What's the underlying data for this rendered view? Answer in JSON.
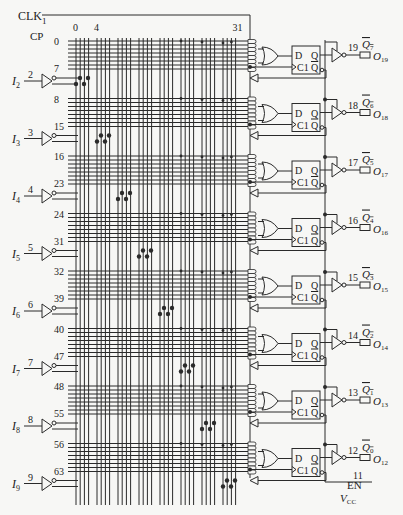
{
  "diagram": {
    "clock_label": "CLK",
    "clock_pin": "1",
    "cp_label": "CP",
    "column_labels": [
      {
        "col": 0,
        "text": "0"
      },
      {
        "col": 4,
        "text": "4"
      },
      {
        "col": 31,
        "text": "31"
      }
    ],
    "inputs": [
      {
        "name": "I",
        "sub": "2",
        "pin": "2",
        "row_first": "0",
        "row_last": "7"
      },
      {
        "name": "I",
        "sub": "3",
        "pin": "3",
        "row_first": "8",
        "row_last": "15"
      },
      {
        "name": "I",
        "sub": "4",
        "pin": "4",
        "row_first": "16",
        "row_last": "23"
      },
      {
        "name": "I",
        "sub": "5",
        "pin": "5",
        "row_first": "24",
        "row_last": "31"
      },
      {
        "name": "I",
        "sub": "6",
        "pin": "6",
        "row_first": "32",
        "row_last": "39"
      },
      {
        "name": "I",
        "sub": "7",
        "pin": "7",
        "row_first": "40",
        "row_last": "47"
      },
      {
        "name": "I",
        "sub": "8",
        "pin": "8",
        "row_first": "48",
        "row_last": "55"
      },
      {
        "name": "I",
        "sub": "9",
        "pin": "9",
        "row_first": "56",
        "row_last": "63"
      }
    ],
    "outputs": [
      {
        "pin": "19",
        "q": "Q",
        "q_sub": "7",
        "o": "O",
        "o_sub": "19"
      },
      {
        "pin": "18",
        "q": "Q",
        "q_sub": "6",
        "o": "O",
        "o_sub": "18"
      },
      {
        "pin": "17",
        "q": "Q",
        "q_sub": "5",
        "o": "O",
        "o_sub": "17"
      },
      {
        "pin": "16",
        "q": "Q",
        "q_sub": "4",
        "o": "O",
        "o_sub": "16"
      },
      {
        "pin": "15",
        "q": "Q",
        "q_sub": "3",
        "o": "O",
        "o_sub": "15"
      },
      {
        "pin": "14",
        "q": "Q",
        "q_sub": "2",
        "o": "O",
        "o_sub": "14"
      },
      {
        "pin": "13",
        "q": "Q",
        "q_sub": "1",
        "o": "O",
        "o_sub": "13"
      },
      {
        "pin": "12",
        "q": "Q",
        "q_sub": "0",
        "o": "O",
        "o_sub": "12"
      }
    ],
    "flipflop": {
      "d": "D",
      "q": "Q",
      "clk": "C1",
      "qbar": "Q"
    },
    "enable": {
      "pin": "11",
      "label": "EN"
    },
    "vcc": {
      "label": "V",
      "sub": "CC"
    },
    "colors": {
      "line": "#2a2a2a",
      "background": "#f7f7f5"
    }
  }
}
